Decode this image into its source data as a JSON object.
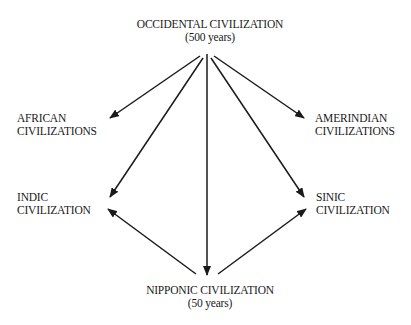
{
  "diagram": {
    "source": {
      "name": "OCCIDENTAL CIVILIZATION",
      "duration": "(500 years)"
    },
    "nodes": {
      "african": {
        "line1": "AFRICAN",
        "line2": "CIVILIZATIONS"
      },
      "amerindian": {
        "line1": "AMERINDIAN",
        "line2": "CIVILIZATIONS"
      },
      "indic": {
        "line1": "INDIC",
        "line2": "CIVILIZATION"
      },
      "sinic": {
        "line1": "SINIC",
        "line2": "CIVILIZATION"
      },
      "nipponic": {
        "name": "NIPPONIC CIVILIZATION",
        "duration": "(50 years)"
      }
    },
    "edges": [
      {
        "from": "occidental",
        "to": "african"
      },
      {
        "from": "occidental",
        "to": "indic"
      },
      {
        "from": "occidental",
        "to": "nipponic"
      },
      {
        "from": "occidental",
        "to": "sinic"
      },
      {
        "from": "occidental",
        "to": "amerindian"
      },
      {
        "from": "nipponic",
        "to": "indic"
      },
      {
        "from": "nipponic",
        "to": "sinic"
      }
    ],
    "colors": {
      "ink": "#1a1a1a",
      "background": "#ffffff"
    }
  }
}
